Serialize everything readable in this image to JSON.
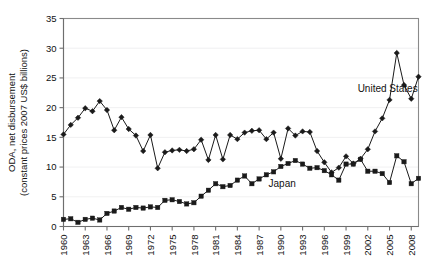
{
  "chart_data": {
    "type": "line",
    "title": "",
    "xlabel": "",
    "ylabel": "ODA, net disbursement (constant prices 2007 US$ billions)",
    "ylabel_line1": "ODA, net disbursement",
    "ylabel_line2": "(constant prices 2007 US$ billions)",
    "grid": true,
    "legend_position": "inline-annotations",
    "xlim": [
      1960,
      2009
    ],
    "ylim": [
      0,
      35
    ],
    "yticks": [
      0,
      5,
      10,
      15,
      20,
      25,
      30,
      35
    ],
    "ytick_labels": [
      "0",
      "5",
      "10",
      "15",
      "20",
      "25",
      "30",
      "35"
    ],
    "xticks": [
      1960,
      1963,
      1966,
      1969,
      1972,
      1975,
      1978,
      1981,
      1984,
      1987,
      1990,
      1993,
      1996,
      1999,
      2002,
      2005,
      2008
    ],
    "xtick_labels": [
      "1960",
      "1963",
      "1966",
      "1969",
      "1972",
      "1975",
      "1978",
      "1981",
      "1984",
      "1987",
      "1990",
      "1993",
      "1996",
      "1999",
      "2002",
      "2005",
      "2008"
    ],
    "x": [
      1960,
      1961,
      1962,
      1963,
      1964,
      1965,
      1966,
      1967,
      1968,
      1969,
      1970,
      1971,
      1972,
      1973,
      1974,
      1975,
      1976,
      1977,
      1978,
      1979,
      1980,
      1981,
      1982,
      1983,
      1984,
      1985,
      1986,
      1987,
      1988,
      1989,
      1990,
      1991,
      1992,
      1993,
      1994,
      1995,
      1996,
      1997,
      1998,
      1999,
      2000,
      2001,
      2002,
      2003,
      2004,
      2005,
      2006,
      2007,
      2008,
      2009
    ],
    "series": [
      {
        "name": "United States",
        "marker": "diamond",
        "color": "#1a1a1a",
        "label_x": 2000.6,
        "label_y": 22.6,
        "values": [
          15.5,
          17.1,
          18.3,
          19.9,
          19.4,
          21.1,
          19.6,
          16.2,
          18.4,
          16.4,
          15.3,
          12.7,
          15.4,
          9.8,
          12.5,
          12.8,
          12.9,
          12.7,
          13.0,
          14.6,
          11.2,
          15.4,
          11.3,
          15.4,
          14.7,
          15.8,
          16.1,
          16.2,
          14.7,
          15.8,
          11.4,
          16.5,
          15.3,
          16.0,
          15.9,
          12.7,
          10.8,
          9.1,
          9.9,
          11.8,
          10.6,
          11.4,
          13.0,
          16.0,
          18.2,
          21.3,
          29.2,
          23.8,
          21.5,
          25.2
        ]
      },
      {
        "name": "Japan",
        "marker": "square",
        "color": "#1a1a1a",
        "label_x": 1988.3,
        "label_y": 6.6,
        "values": [
          1.2,
          1.3,
          0.7,
          1.2,
          1.4,
          1.1,
          2.2,
          2.6,
          3.2,
          2.9,
          3.2,
          3.1,
          3.3,
          3.2,
          4.4,
          4.5,
          4.2,
          3.8,
          4.0,
          5.1,
          6.1,
          7.2,
          6.7,
          6.9,
          7.8,
          8.5,
          7.2,
          8.0,
          8.7,
          9.2,
          10.1,
          10.6,
          11.1,
          10.5,
          9.8,
          9.9,
          9.4,
          8.7,
          7.8,
          10.5,
          10.5,
          11.3,
          9.3,
          9.3,
          8.9,
          7.4,
          11.9,
          10.9,
          7.2,
          8.1
        ]
      }
    ]
  },
  "annotations": {
    "united_states_label": "United States",
    "japan_label": "Japan"
  }
}
